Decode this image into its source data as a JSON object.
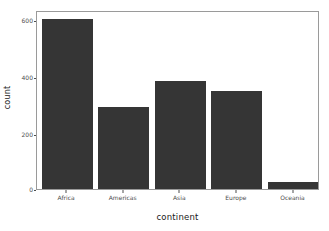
{
  "chart_data": {
    "type": "bar",
    "title": "",
    "subtitle": "",
    "xlabel": "continent",
    "ylabel": "count",
    "categories": [
      "Africa",
      "Americas",
      "Asia",
      "Europe",
      "Oceania"
    ],
    "values": [
      624,
      300,
      396,
      360,
      24
    ],
    "series": [
      {
        "name": "count",
        "values": [
          624,
          300,
          396,
          360,
          24
        ]
      }
    ],
    "xlim": [
      0,
      5
    ],
    "ylim": [
      0,
      650
    ],
    "y_ticks": [
      0,
      200,
      400,
      600
    ],
    "y_tick_labels": [
      "0",
      "200",
      "400",
      "600"
    ],
    "x_tick_labels": [
      "Africa",
      "Americas",
      "Asia",
      "Europe",
      "Oceania"
    ],
    "grid": false,
    "legend": false,
    "legend_position": "none",
    "annotations": [],
    "bar_color": "#353535",
    "panel_background": "#ffffff",
    "panel_border_color": "#9a9a9a",
    "axis_text_color": "#4d4d4d",
    "axis_title_color": "#1a1a1a"
  },
  "axes": {
    "y_title": "count",
    "x_title": "continent",
    "y_tick_0": "0",
    "y_tick_1": "200",
    "y_tick_2": "400",
    "y_tick_3": "600",
    "x_tick_0": "Africa",
    "x_tick_1": "Americas",
    "x_tick_2": "Asia",
    "x_tick_3": "Europe",
    "x_tick_4": "Oceania"
  }
}
